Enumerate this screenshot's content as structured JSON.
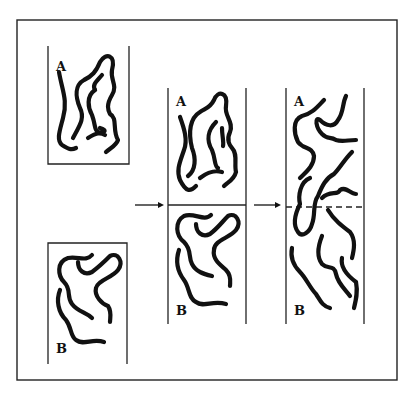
{
  "diagram": {
    "stages": [
      {
        "id": "separate",
        "label_top": "A",
        "label_bottom": "B",
        "note": "Two separate polymer samples"
      },
      {
        "id": "contact",
        "label_top": "A",
        "label_bottom": "B",
        "note": "Samples brought into contact at interface"
      },
      {
        "id": "interdiffused",
        "label_top": "A",
        "label_bottom": "B",
        "note": "Chains diffuse across interface (dashed line)"
      }
    ],
    "arrows": [
      {
        "from": "separate",
        "to": "contact"
      },
      {
        "from": "contact",
        "to": "interdiffused"
      }
    ],
    "colors": {
      "ink": "#111111",
      "background": "#ffffff"
    }
  }
}
